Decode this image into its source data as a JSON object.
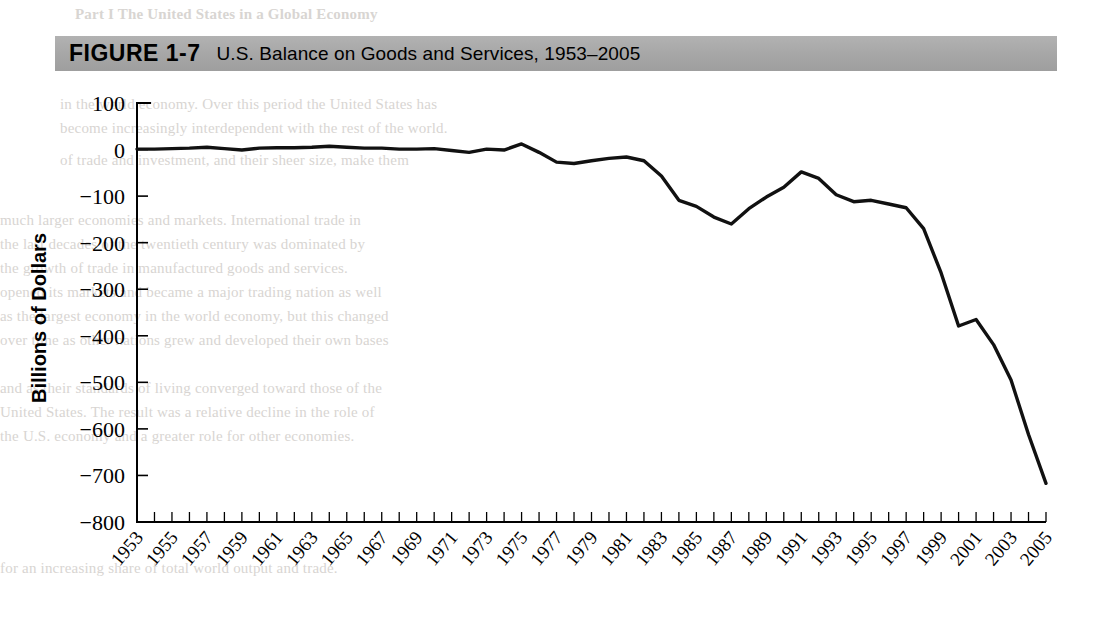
{
  "banner": {
    "figure_label": "FIGURE 1-7",
    "title": "U.S. Balance on Goods and Services, 1953–2005",
    "background_color": "#a6a6a6"
  },
  "page_ghost_text": [
    "Part I  The United States in a Global Economy",
    "in the world economy. Over this period the United States has",
    "become increasingly interdependent with the rest of the world.",
    "of trade and investment, and their sheer size, make them",
    "much larger economies and markets. International trade in",
    "the last decades of the twentieth century was dominated by",
    "the growth of trade in manufactured goods and services.",
    "opened its markets and became a major trading nation as well",
    "as the largest economy in the world economy, but this changed",
    "over time as other nations grew and developed their own bases",
    "and as their standards of living converged toward those of the",
    "United States. The result was a relative decline in the role of",
    "the U.S. economy and a greater role for other economies.",
    "for an increasing share of total world output and trade."
  ],
  "chart_data": {
    "type": "line",
    "title": "U.S. Balance on Goods and Services, 1953–2005",
    "xlabel": "",
    "ylabel": "Billions of Dollars",
    "ylim": [
      -800,
      100
    ],
    "xlim": [
      1953,
      2005
    ],
    "ytick_labels": [
      "100",
      "0",
      "-100",
      "-200",
      "-300",
      "-400",
      "-500",
      "-600",
      "-700",
      "-800"
    ],
    "ytick_values": [
      100,
      0,
      -100,
      -200,
      -300,
      -400,
      -500,
      -600,
      -700,
      -800
    ],
    "xtick_labels": [
      "1953",
      "1955",
      "1957",
      "1959",
      "1961",
      "1963",
      "1965",
      "1967",
      "1969",
      "1971",
      "1973",
      "1975",
      "1977",
      "1979",
      "1981",
      "1983",
      "1985",
      "1987",
      "1989",
      "1991",
      "1993",
      "1995",
      "1997",
      "1999",
      "2001",
      "2003",
      "2005"
    ],
    "xtick_step_years": 1,
    "xlabel_step_years": 2,
    "grid": false,
    "legend": null,
    "line_color": "#111111",
    "series": [
      {
        "name": "U.S. Balance on Goods and Services",
        "units": "Billions of Dollars",
        "x": [
          1953,
          1954,
          1955,
          1956,
          1957,
          1958,
          1959,
          1960,
          1961,
          1962,
          1963,
          1964,
          1965,
          1966,
          1967,
          1968,
          1969,
          1970,
          1971,
          1972,
          1973,
          1974,
          1975,
          1976,
          1977,
          1978,
          1979,
          1980,
          1981,
          1982,
          1983,
          1984,
          1985,
          1986,
          1987,
          1988,
          1989,
          1990,
          1991,
          1992,
          1993,
          1994,
          1995,
          1996,
          1997,
          1998,
          1999,
          2000,
          2001,
          2002,
          2003,
          2004,
          2005
        ],
        "values": [
          1,
          1,
          2,
          3,
          5,
          2,
          -1,
          3,
          4,
          4,
          5,
          7,
          5,
          3,
          3,
          1,
          1,
          2,
          -2,
          -6,
          1,
          -1,
          12,
          -6,
          -27,
          -30,
          -24,
          -19,
          -16,
          -24,
          -57,
          -109,
          -122,
          -145,
          -160,
          -127,
          -102,
          -81,
          -48,
          -62,
          -97,
          -112,
          -109,
          -117,
          -125,
          -170,
          -265,
          -379,
          -365,
          -419,
          -495,
          -612,
          -717
        ]
      }
    ],
    "annotations": [
      {
        "text": "surplus peak",
        "year": 1975,
        "value": 12
      },
      {
        "text": "trough before recovery",
        "year": 1987,
        "value": -160
      },
      {
        "text": "local improvement",
        "year": 1991,
        "value": -48
      },
      {
        "text": "record deficit",
        "year": 2005,
        "value": -717
      }
    ]
  }
}
